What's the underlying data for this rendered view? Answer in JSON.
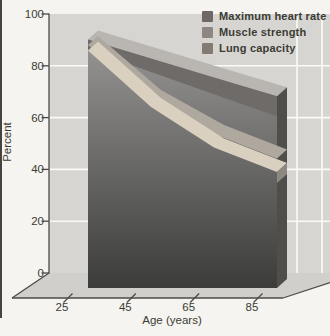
{
  "chart_data": {
    "type": "area",
    "style": "3d-perspective-stacked-ribbons",
    "title": "",
    "xlabel": "Age (years)",
    "ylabel": "Percent",
    "x": [
      25,
      45,
      65,
      85
    ],
    "ylim": [
      0,
      100
    ],
    "yticks": [
      0,
      20,
      40,
      60,
      80,
      100
    ],
    "grid": true,
    "legend_position": "top-right",
    "series": [
      {
        "name": "Maximum heart rate",
        "values": [
          92,
          85,
          78,
          71
        ],
        "swatch_color": "#6e6764",
        "ribbon_color": "#6f6b68"
      },
      {
        "name": "Muscle strength",
        "values": [
          90,
          70,
          57,
          48
        ],
        "swatch_color": "#8e8781",
        "ribbon_color": "#aea89f"
      },
      {
        "name": "Lung capacity",
        "values": [
          88,
          67,
          52,
          43
        ],
        "swatch_color": "#827b74",
        "ribbon_color": "#d9d0c0"
      }
    ],
    "palette": {
      "wall": "#d6d5d2",
      "floor": "#d0cfcc",
      "background": "#f5f4f1",
      "gridline": "#fafaf8",
      "body_top": "#989795",
      "body_bottom": "#3b3b39",
      "top_face": "#b9b6b2",
      "right_face": "#504e4b",
      "axis": "#4c4b47",
      "text": "#3b3b33"
    }
  }
}
